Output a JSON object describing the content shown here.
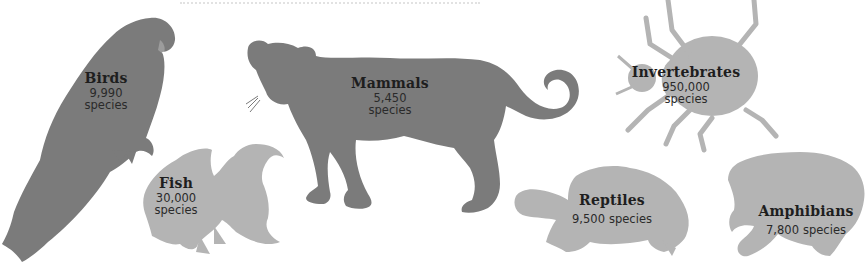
{
  "colors": {
    "dark_silhouette": "#7b7b7b",
    "light_silhouette": "#b4b4b4",
    "text": "#1e1e1e",
    "background": "#ffffff"
  },
  "groups": [
    {
      "id": "birds",
      "name": "Birds",
      "count": "9,990",
      "unit": "species",
      "icon": "parrot-icon",
      "shade": "dark"
    },
    {
      "id": "fish",
      "name": "Fish",
      "count": "30,000",
      "unit": "species",
      "icon": "goldfish-icon",
      "shade": "light"
    },
    {
      "id": "mammals",
      "name": "Mammals",
      "count": "5,450",
      "unit": "species",
      "icon": "big-cat-icon",
      "shade": "dark"
    },
    {
      "id": "invertebrates",
      "name": "Invertebrates",
      "count": "950,000",
      "unit": "species",
      "icon": "beetle-icon",
      "shade": "light"
    },
    {
      "id": "reptiles",
      "name": "Reptiles",
      "count": "9,500",
      "unit": "species",
      "icon": "tortoise-icon",
      "shade": "light"
    },
    {
      "id": "amphibians",
      "name": "Amphibians",
      "count": "7,800",
      "unit": "species",
      "icon": "frog-icon",
      "shade": "light"
    }
  ]
}
